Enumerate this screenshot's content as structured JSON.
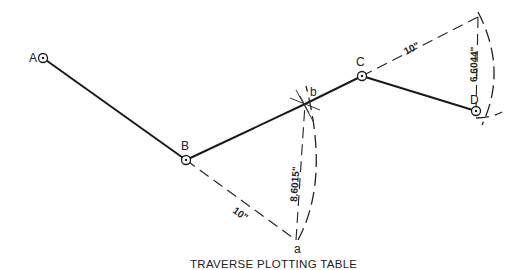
{
  "diagram": {
    "title": "TRAVERSE PLOTTING TABLE",
    "stations": [
      {
        "id": "A",
        "label": "A",
        "x": 43,
        "y": 58
      },
      {
        "id": "B",
        "label": "B",
        "x": 186,
        "y": 160
      },
      {
        "id": "C",
        "label": "C",
        "x": 362,
        "y": 76
      },
      {
        "id": "D",
        "label": "D",
        "x": 476,
        "y": 111
      }
    ],
    "construction_points": [
      {
        "id": "a",
        "label": "a",
        "x": 296,
        "y": 240
      },
      {
        "id": "b",
        "label": "b",
        "x": 305,
        "y": 104
      }
    ],
    "dimensions": {
      "Ba_chord": "10\"",
      "ab_offset": "8.6015\"",
      "Cd_chord": "10\"",
      "dD_offset": "6.6044\""
    },
    "colors": {
      "line": "#1a1a1a",
      "background": "#ffffff"
    }
  }
}
